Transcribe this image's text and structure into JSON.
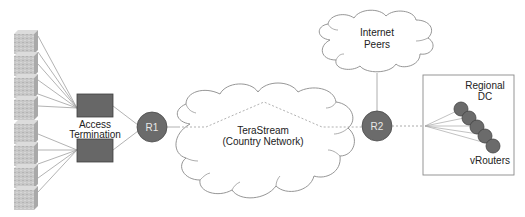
{
  "diagram": {
    "colors": {
      "router_fill": "#6b6b6b",
      "router_stroke": "#4a4a4a",
      "access_fill": "#676767",
      "server_fill": "#c4c4c4",
      "cloud_stroke": "#8a8a8a",
      "line": "#9a9a9a",
      "dashed_line": "#a8a8a8"
    },
    "access_termination": {
      "label_line1": "Access",
      "label_line2": "Termination"
    },
    "routers": [
      {
        "id": "R1",
        "label": "R1"
      },
      {
        "id": "R2",
        "label": "R2"
      }
    ],
    "core_cloud": {
      "label_line1": "TeraStream",
      "label_line2": "(Country Network)"
    },
    "peers_cloud": {
      "label_line1": "Internet",
      "label_line2": "Peers"
    },
    "regional_dc": {
      "label_line1": "Regional",
      "label_line2": "DC",
      "vrouters_label": "vRouters",
      "vrouter_count": 5
    },
    "server_stacks": [
      {
        "group": "upper",
        "servers": 4
      },
      {
        "group": "lower",
        "servers": 4
      }
    ]
  }
}
